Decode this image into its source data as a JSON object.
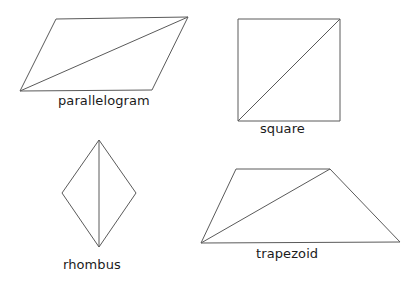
{
  "figure": {
    "background_color": "#ffffff",
    "stroke_color": "#5a5a5a",
    "text_color": "#1b1b1b",
    "width": 420,
    "height": 291
  },
  "shapes": [
    {
      "name": "parallelogram",
      "label": "parallelogram",
      "outline_points": "56,19 188,17 152,90 20,91",
      "diagonal_points": "20,91 188,17"
    },
    {
      "name": "square",
      "label": "square",
      "outline_points": "238,19 340,19 340,121 238,121",
      "diagonal_points": "238,121 340,19"
    },
    {
      "name": "rhombus",
      "label": "rhombus",
      "outline_points": "99,140 136,193 99,247 62,193",
      "diagonal_points": "99,140 99,247"
    },
    {
      "name": "trapezoid",
      "label": "trapezoid",
      "outline_points": "236,169 330,169 400,242 201,243",
      "diagonal_points": "201,243 330,169"
    }
  ]
}
